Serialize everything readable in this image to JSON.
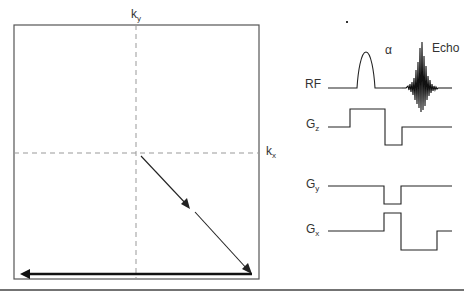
{
  "kspace": {
    "ky_label": "k",
    "ky_sub": "y",
    "kx_label": "k",
    "kx_sub": "x"
  },
  "sequence": {
    "rf_label": "RF",
    "alpha_label": "α",
    "echo_label": "Echo",
    "gz_label": "G",
    "gz_sub": "z",
    "gy_label": "G",
    "gy_sub": "y",
    "gx_label": "G",
    "gx_sub": "x"
  },
  "colors": {
    "line": "#222222",
    "dashed": "#999999",
    "box": "#555555"
  }
}
